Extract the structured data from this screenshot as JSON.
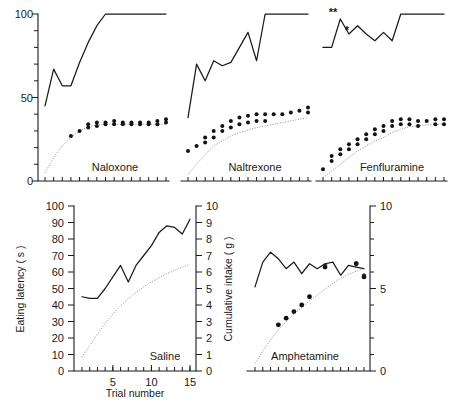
{
  "figure": {
    "title": "",
    "background_color": "#ffffff",
    "ink_color": "#1a1a1a",
    "dotted_color": "#8d8d8d"
  },
  "axis_titles": {
    "eating_latency": "Eating latency ( s )",
    "cumulative_intake": "Cumulative intake ( g )",
    "trial_number": "Trial number"
  },
  "panel_labels": {
    "naloxone": "Naloxone",
    "naltrexone": "Naltrexone",
    "fenfluramine": "Fenfluramine",
    "saline": "Saline",
    "amphetamine": "Amphetamine"
  },
  "significance_marks": {
    "double": "**",
    "single": "*"
  },
  "tick_labels": {
    "top_left_y": [
      "0",
      "50",
      "100"
    ],
    "bottom_left_y_left": [
      "0",
      "10",
      "20",
      "30",
      "40",
      "50",
      "60",
      "70",
      "80",
      "90",
      "100"
    ],
    "bottom_left_y_right": [
      "0",
      "1",
      "2",
      "3",
      "4",
      "5",
      "6",
      "7",
      "8",
      "9",
      "10"
    ],
    "bottom_left_x": [
      "5",
      "10",
      "15"
    ],
    "bottom_right_y_right": [
      "0",
      "5",
      "10"
    ]
  },
  "chart_data": [
    {
      "id": "naloxone",
      "type": "line",
      "title": "Naloxone",
      "xlabel": "Trial number",
      "ylabel": "Eating latency ( s )",
      "xlim": [
        1,
        15
      ],
      "ylim": [
        0,
        100
      ],
      "grid": false,
      "legend": "none",
      "x": [
        1,
        2,
        3,
        4,
        5,
        6,
        7,
        8,
        9,
        10,
        11,
        12,
        13,
        14,
        15
      ],
      "series": [
        {
          "name": "Eating latency (s)",
          "style": "solid-line",
          "values": [
            45,
            67,
            57,
            57,
            71,
            83,
            93,
            100,
            100,
            100,
            100,
            100,
            100,
            100,
            100
          ]
        },
        {
          "name": "Cumulative intake (g) model",
          "style": "dotted-line",
          "axis": "right",
          "values": [
            0.5,
            1.4,
            2.1,
            2.6,
            3.0,
            3.25,
            3.35,
            3.4,
            3.4,
            3.4,
            3.4,
            3.4,
            3.4,
            3.4,
            3.4
          ]
        },
        {
          "name": "Cumulative intake (g) observed",
          "style": "points",
          "axis": "right",
          "values": [
            null,
            null,
            null,
            2.7,
            3.0,
            3.4,
            3.5,
            3.5,
            3.6,
            3.5,
            3.5,
            3.5,
            3.5,
            3.6,
            3.7
          ],
          "paired_values": [
            null,
            null,
            null,
            null,
            null,
            3.2,
            3.3,
            3.4,
            3.4,
            3.4,
            3.4,
            3.4,
            3.4,
            3.4,
            3.5
          ]
        }
      ]
    },
    {
      "id": "naltrexone",
      "type": "line",
      "title": "Naltrexone",
      "xlabel": "Trial number",
      "ylabel": "Eating latency ( s )",
      "xlim": [
        1,
        15
      ],
      "ylim": [
        0,
        100
      ],
      "grid": false,
      "legend": "none",
      "x": [
        1,
        2,
        3,
        4,
        5,
        6,
        7,
        8,
        9,
        10,
        11,
        12,
        13,
        14,
        15
      ],
      "series": [
        {
          "name": "Eating latency (s)",
          "style": "solid-line",
          "values": [
            38,
            70,
            60,
            72,
            69,
            71,
            80,
            89,
            72,
            100,
            100,
            100,
            100,
            100,
            100
          ]
        },
        {
          "name": "Cumulative intake (g) model",
          "style": "dotted-line",
          "axis": "right",
          "values": [
            0.4,
            1.0,
            1.6,
            2.1,
            2.4,
            2.7,
            2.9,
            3.05,
            3.2,
            3.3,
            3.4,
            3.5,
            3.6,
            3.7,
            3.8
          ],
          "values_alt": [
            0.4,
            1.0,
            1.6,
            2.1,
            2.4,
            2.7,
            2.9,
            3.05,
            3.2,
            3.3,
            3.4,
            3.5,
            3.6,
            3.7,
            3.8
          ]
        },
        {
          "name": "Cumulative intake (g) observed",
          "style": "points",
          "axis": "right",
          "values": [
            1.8,
            2.1,
            2.6,
            3.0,
            3.3,
            3.6,
            3.8,
            3.9,
            4.0,
            4.0,
            4.0,
            4.0,
            4.1,
            4.2,
            4.4
          ],
          "paired_values": [
            null,
            null,
            2.3,
            2.6,
            3.0,
            3.2,
            3.4,
            3.5,
            3.6,
            3.6,
            null,
            null,
            null,
            null,
            4.1
          ]
        }
      ]
    },
    {
      "id": "fenfluramine",
      "type": "line",
      "title": "Fenfluramine",
      "xlabel": "Trial number",
      "ylabel": "Eating latency ( s )",
      "xlim": [
        1,
        15
      ],
      "ylim": [
        0,
        100
      ],
      "grid": false,
      "legend": "none",
      "annotations": [
        {
          "text": "**",
          "x": 3,
          "y": 100,
          "placement": "above"
        },
        {
          "text": "*",
          "x": 4,
          "y": 93,
          "placement": "above"
        }
      ],
      "x": [
        1,
        2,
        3,
        4,
        5,
        6,
        7,
        8,
        9,
        10,
        11,
        12,
        13,
        14,
        15
      ],
      "series": [
        {
          "name": "Eating latency (s)",
          "style": "solid-line",
          "values": [
            80,
            80,
            97,
            88,
            93,
            88,
            84,
            89,
            84,
            100,
            100,
            100,
            100,
            100,
            100
          ]
        },
        {
          "name": "Cumulative intake (g) model",
          "style": "dotted-line",
          "axis": "right",
          "values": [
            0.2,
            0.6,
            1.0,
            1.4,
            1.8,
            2.1,
            2.4,
            2.6,
            2.9,
            3.1,
            3.25,
            3.3,
            3.35,
            3.4,
            3.4
          ]
        },
        {
          "name": "Cumulative intake (g) observed",
          "style": "points",
          "axis": "right",
          "values": [
            0.7,
            1.5,
            1.9,
            2.2,
            2.5,
            2.8,
            3.1,
            3.3,
            3.6,
            3.7,
            3.7,
            3.6,
            3.6,
            3.7,
            3.7
          ],
          "paired_values": [
            null,
            1.2,
            1.6,
            1.9,
            2.2,
            2.5,
            2.8,
            3.0,
            3.3,
            3.4,
            3.4,
            3.3,
            null,
            3.4,
            3.4
          ]
        }
      ]
    },
    {
      "id": "saline",
      "type": "line",
      "title": "Saline",
      "xlabel": "Trial number",
      "ylabel": "Eating latency ( s )",
      "ylabel_right": "Cumulative intake ( g )",
      "xlim": [
        1,
        15
      ],
      "ylim": [
        0,
        100
      ],
      "ylim_right": [
        0,
        10
      ],
      "grid": false,
      "legend": "none",
      "x": [
        1,
        2,
        3,
        4,
        5,
        6,
        7,
        8,
        9,
        10,
        11,
        12,
        13,
        14,
        15
      ],
      "series": [
        {
          "name": "Eating latency (s)",
          "style": "solid-line",
          "values": [
            45,
            44,
            44,
            50,
            57,
            64,
            54,
            64,
            70,
            76,
            84,
            88,
            87,
            83,
            92
          ]
        },
        {
          "name": "Cumulative intake (g)",
          "style": "dotted-line",
          "axis": "right",
          "values": [
            0.85,
            1.55,
            2.25,
            2.9,
            3.45,
            3.95,
            4.4,
            4.75,
            5.1,
            5.4,
            5.65,
            5.9,
            6.1,
            6.3,
            6.45
          ]
        }
      ]
    },
    {
      "id": "amphetamine",
      "type": "line",
      "title": "Amphetamine",
      "xlabel": "Trial number",
      "ylabel_right": "Cumulative intake ( g )",
      "xlim": [
        1,
        15
      ],
      "ylim": [
        0,
        100
      ],
      "ylim_right": [
        0,
        10
      ],
      "grid": false,
      "legend": "none",
      "annotations": [
        {
          "text": "*",
          "x": 10,
          "y": 63,
          "placement": "marker"
        },
        {
          "text": "*",
          "x": 14,
          "y": 64,
          "placement": "marker"
        },
        {
          "text": "*",
          "x": 15,
          "y": 57,
          "placement": "marker"
        }
      ],
      "x": [
        1,
        2,
        3,
        4,
        5,
        6,
        7,
        8,
        9,
        10,
        11,
        12,
        13,
        14,
        15
      ],
      "series": [
        {
          "name": "Eating latency (s)",
          "style": "solid-line",
          "values": [
            51,
            66,
            72,
            68,
            62,
            66,
            59,
            65,
            62,
            65,
            66,
            58,
            64,
            63,
            62
          ]
        },
        {
          "name": "Cumulative intake (g) model",
          "style": "dotted-line",
          "axis": "right",
          "values": [
            0.45,
            1.2,
            1.9,
            2.5,
            3.0,
            3.45,
            3.85,
            4.25,
            4.6,
            4.95,
            5.3,
            5.6,
            5.85,
            6.05,
            6.2
          ]
        },
        {
          "name": "Cumulative intake (g) observed",
          "style": "points",
          "axis": "right",
          "values": [
            null,
            null,
            null,
            2.8,
            3.2,
            3.6,
            4.0,
            4.5,
            null,
            6.3,
            null,
            null,
            null,
            6.5,
            5.7
          ]
        }
      ]
    }
  ]
}
